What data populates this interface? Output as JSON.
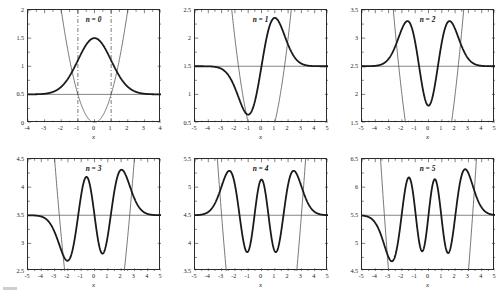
{
  "figure": {
    "background_color": "#ffffff",
    "axis_color": "#2b2b2b",
    "wave_color": "#1a1a1a",
    "potential_color": "#555555",
    "energy_line_color": "#666666",
    "turning_line_color": "#444444",
    "rows": 2,
    "cols": 3
  },
  "chart_data": {
    "type": "line",
    "title": "",
    "xlabel": "x",
    "ylabel": "",
    "grid": false,
    "legend": "none",
    "panels": [
      {
        "id": "panel-n0",
        "label": "n = 0",
        "n": 0,
        "energy": 0.5,
        "xlabel": "x",
        "xlim": [
          -4,
          4
        ],
        "ylim": [
          0,
          2
        ],
        "xticks": [
          -4,
          -3,
          -2,
          -1,
          0,
          1,
          2,
          3,
          4
        ],
        "xticklabels": [
          "-4",
          "-3",
          "-2",
          "-1",
          "0",
          "1",
          "2",
          "3",
          "4"
        ],
        "yticks": [
          0,
          0.5,
          1,
          1.5,
          2
        ],
        "yticklabels": [
          "0",
          "0.5",
          "1",
          "1.5",
          "2"
        ],
        "turning_points": [
          -1,
          1
        ],
        "turning_point_style": "dash-dot",
        "wave_peaks": [
          {
            "x": 0,
            "y": 1.5
          }
        ],
        "wave_baseline": 0.5,
        "nodes": []
      },
      {
        "id": "panel-n1",
        "label": "n = 1",
        "n": 1,
        "energy": 1.5,
        "xlabel": "x",
        "xlim": [
          -5,
          5
        ],
        "ylim": [
          0.5,
          2.5
        ],
        "xticks": [
          -5,
          -4,
          -3,
          -2,
          -1,
          0,
          1,
          2,
          3,
          4,
          5
        ],
        "xticklabels": [
          "-5",
          "-4",
          "-3",
          "-2",
          "-1",
          "0",
          "1",
          "2",
          "3",
          "4",
          "5"
        ],
        "yticks": [
          0.5,
          1,
          1.5,
          2,
          2.5
        ],
        "yticklabels": [
          "0.5",
          "1",
          "1.5",
          "2",
          "2.5"
        ],
        "turning_points": [],
        "turning_point_style": "none",
        "wave_peaks": [
          {
            "x": -1,
            "y": 0.64
          },
          {
            "x": 1,
            "y": 2.36
          }
        ],
        "wave_baseline": 1.5,
        "nodes": [
          0
        ]
      },
      {
        "id": "panel-n2",
        "label": "n = 2",
        "n": 2,
        "energy": 2.5,
        "xlabel": "x",
        "xlim": [
          -5,
          5
        ],
        "ylim": [
          1.5,
          3.5
        ],
        "xticks": [
          -5,
          -4,
          -3,
          -2,
          -1,
          0,
          1,
          2,
          3,
          4,
          5
        ],
        "xticklabels": [
          "-5",
          "-4",
          "-3",
          "-2",
          "-1",
          "0",
          "1",
          "2",
          "3",
          "4",
          "5"
        ],
        "yticks": [
          1.5,
          2,
          2.5,
          3,
          3.5
        ],
        "yticklabels": [
          "1.5",
          "2",
          "2.5",
          "3",
          "3.5"
        ],
        "turning_points": [],
        "turning_point_style": "none",
        "wave_peaks": [
          {
            "x": -1.6,
            "y": 3.3
          },
          {
            "x": 0,
            "y": 1.8
          },
          {
            "x": 1.6,
            "y": 3.3
          }
        ],
        "wave_baseline": 2.5,
        "nodes": [
          -0.71,
          0.71
        ]
      },
      {
        "id": "panel-n3",
        "label": "n = 3",
        "n": 3,
        "energy": 3.5,
        "xlabel": "x",
        "xlim": [
          -5,
          5
        ],
        "ylim": [
          2.5,
          4.5
        ],
        "xticks": [
          -5,
          -4,
          -3,
          -2,
          -1,
          0,
          1,
          2,
          3,
          4,
          5
        ],
        "xticklabels": [
          "-5",
          "-4",
          "-3",
          "-2",
          "-1",
          "0",
          "1",
          "2",
          "3",
          "4",
          "5"
        ],
        "yticks": [
          2.5,
          3,
          3.5,
          4,
          4.5
        ],
        "yticklabels": [
          "2.5",
          "3",
          "3.5",
          "4",
          "4.5"
        ],
        "turning_points": [],
        "turning_point_style": "none",
        "wave_peaks": [
          {
            "x": -2.2,
            "y": 2.73
          },
          {
            "x": -0.65,
            "y": 4.17
          },
          {
            "x": 0.65,
            "y": 2.85
          },
          {
            "x": 2.2,
            "y": 4.28
          }
        ],
        "wave_baseline": 3.5,
        "nodes": [
          -1.46,
          0,
          1.46
        ]
      },
      {
        "id": "panel-n4",
        "label": "n = 4",
        "n": 4,
        "energy": 4.5,
        "xlabel": "x",
        "xlim": [
          -5,
          5
        ],
        "ylim": [
          3.5,
          5.5
        ],
        "xticks": [
          -5,
          -4,
          -3,
          -2,
          -1,
          0,
          1,
          2,
          3,
          4,
          5
        ],
        "xticklabels": [
          "-5",
          "-4",
          "-3",
          "-2",
          "-1",
          "0",
          "1",
          "2",
          "3",
          "4",
          "5"
        ],
        "yticks": [
          3.5,
          4,
          4.5,
          5,
          5.5
        ],
        "yticklabels": [
          "3.5",
          "4",
          "4.5",
          "5",
          "5.5"
        ],
        "turning_points": [],
        "turning_point_style": "none",
        "wave_peaks": [
          {
            "x": -2.55,
            "y": 5.27
          },
          {
            "x": -1.15,
            "y": 3.88
          },
          {
            "x": 0,
            "y": 5.1
          },
          {
            "x": 1.15,
            "y": 3.88
          },
          {
            "x": 2.55,
            "y": 5.27
          }
        ],
        "wave_baseline": 4.5,
        "nodes": [
          -1.95,
          -0.52,
          0.52,
          1.95
        ]
      },
      {
        "id": "panel-n5",
        "label": "n = 5",
        "n": 5,
        "energy": 5.5,
        "xlabel": "x",
        "xlim": [
          -5,
          5
        ],
        "ylim": [
          4.5,
          6.5
        ],
        "xticks": [
          -5,
          -4,
          -3,
          -2,
          -1,
          0,
          1,
          2,
          3,
          4,
          5
        ],
        "xticklabels": [
          "-5",
          "-4",
          "-3",
          "-2",
          "-1",
          "0",
          "1",
          "2",
          "3",
          "4",
          "5"
        ],
        "yticks": [
          4.5,
          5,
          5.5,
          6,
          6.5
        ],
        "yticklabels": [
          "4.5",
          "5",
          "5.5",
          "6",
          "6.5"
        ],
        "turning_points": [],
        "turning_point_style": "none",
        "wave_peaks": [
          {
            "x": -2.95,
            "y": 4.76
          },
          {
            "x": -1.5,
            "y": 6.13
          },
          {
            "x": -0.4,
            "y": 4.88
          },
          {
            "x": 0.45,
            "y": 6.1
          },
          {
            "x": 1.55,
            "y": 4.88
          },
          {
            "x": 2.8,
            "y": 6.26
          }
        ],
        "wave_baseline": 5.5,
        "nodes": [
          -2.35,
          -1.0,
          0,
          1.0,
          2.35
        ]
      }
    ]
  }
}
